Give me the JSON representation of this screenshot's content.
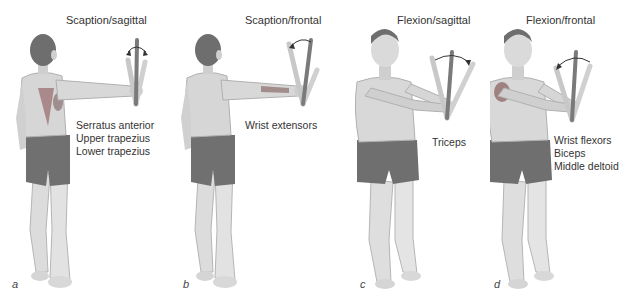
{
  "figure": {
    "panels": [
      {
        "id": "a",
        "letter": "a",
        "title": "Scaption/sagittal",
        "view": "back",
        "muscles": [
          "Serratus anterior",
          "Upper trapezius",
          "Lower trapezius"
        ]
      },
      {
        "id": "b",
        "letter": "b",
        "title": "Scaption/frontal",
        "view": "back",
        "muscles": [
          "Wrist extensors"
        ]
      },
      {
        "id": "c",
        "letter": "c",
        "title": "Flexion/sagittal",
        "view": "front",
        "muscles": [
          "Triceps"
        ]
      },
      {
        "id": "d",
        "letter": "d",
        "title": "Flexion/frontal",
        "view": "front",
        "muscles": [
          "Wrist flexors",
          "Biceps",
          "Middle deltoid"
        ]
      }
    ],
    "colors": {
      "skin": "#d9d9d9",
      "skin_shadow": "#a9a9a9",
      "hair": "#6a6a6a",
      "shorts": "#6e6e6e",
      "muscle_highlight": "#8a6a6a",
      "rod": "#7a7a7a",
      "rod_light": "#c8c8c8",
      "arrow": "#333333"
    }
  }
}
